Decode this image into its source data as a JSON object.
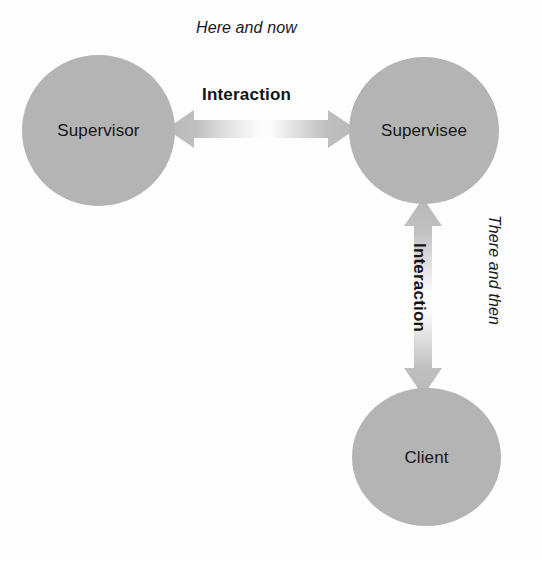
{
  "diagram": {
    "type": "relationship-diagram",
    "width": 543,
    "height": 561,
    "background_color": "#fdfdfd",
    "node_fill_color": "#b4b4b4",
    "arrow_color": "#b9b9b9",
    "text_color": "#17171a"
  },
  "nodes": [
    {
      "id": "supervisor",
      "label": "Supervisor",
      "shape": "circle",
      "position": "top-left"
    },
    {
      "id": "supervisee",
      "label": "Supervisee",
      "shape": "circle",
      "position": "top-right"
    },
    {
      "id": "client",
      "label": "Client",
      "shape": "circle",
      "position": "bottom-right"
    }
  ],
  "connectors": [
    {
      "id": "supervisor-supervisee",
      "label": "Interaction",
      "from": "supervisor",
      "to": "supervisee",
      "orientation": "horizontal",
      "heads": "double"
    },
    {
      "id": "supervisee-client",
      "label": "Interaction",
      "from": "supervisee",
      "to": "client",
      "orientation": "vertical",
      "heads": "double"
    }
  ],
  "context_labels": [
    {
      "id": "here-and-now",
      "text": "Here and now",
      "style": "italic",
      "position": "top-center"
    },
    {
      "id": "there-and-then",
      "text": "There and then",
      "style": "italic",
      "position": "right-rotated"
    }
  ]
}
